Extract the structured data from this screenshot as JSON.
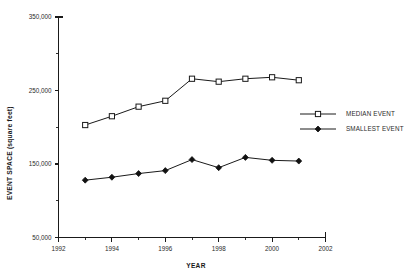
{
  "chart_data": {
    "type": "line",
    "title": "",
    "xlabel": "YEAR",
    "ylabel": "EVENT SPACE (square feet)",
    "xlim": [
      1992,
      2002
    ],
    "ylim": [
      50000,
      350000
    ],
    "x_ticks": [
      1992,
      1994,
      1996,
      1998,
      2000,
      2002
    ],
    "x_tick_labels": [
      "1992",
      "1994",
      "1996",
      "1998",
      "2000",
      "2002"
    ],
    "x_minor_ticks": [
      1993,
      1995,
      1997,
      1999,
      2001
    ],
    "y_ticks": [
      50000,
      150000,
      250000,
      350000
    ],
    "y_tick_labels": [
      "50,000",
      "150,000",
      "250,000",
      "350,000"
    ],
    "y_minor_ticks": [
      100000,
      200000,
      300000
    ],
    "grid": false,
    "legend_position": "right-middle",
    "x": [
      1993,
      1994,
      1995,
      1996,
      1997,
      1998,
      1999,
      2000,
      2001
    ],
    "series": [
      {
        "name": "MEDIAN EVENT",
        "marker": "open-square",
        "values": [
          203000,
          215000,
          228000,
          236000,
          266000,
          262000,
          266000,
          268000,
          264000
        ]
      },
      {
        "name": "SMALLEST EVENT",
        "marker": "filled-diamond",
        "values": [
          128000,
          132000,
          137000,
          141000,
          156000,
          145000,
          159000,
          155000,
          154000
        ]
      }
    ]
  },
  "legend": {
    "entries": [
      {
        "label": "MEDIAN EVENT"
      },
      {
        "label": "SMALLEST EVENT"
      }
    ]
  },
  "colors": {
    "ink": "#1a1a1a",
    "background": "#ffffff",
    "marker_fill_open": "#ffffff",
    "marker_fill_solid": "#111111"
  }
}
